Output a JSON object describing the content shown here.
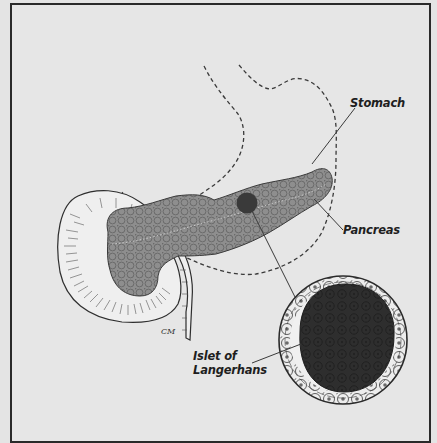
{
  "diagram": {
    "type": "anatomical-illustration",
    "labels": {
      "stomach": "Stomach",
      "pancreas": "Pancreas",
      "islet_line1": "Islet of",
      "islet_line2": "Langerhans"
    },
    "signature": "CM",
    "colors": {
      "background": "#e4e4e4",
      "frame": "#2a2a2a",
      "pancreas_fill": "#8c8c8c",
      "islet_core": "#2e2e2e",
      "line": "#3a3a3a"
    }
  }
}
